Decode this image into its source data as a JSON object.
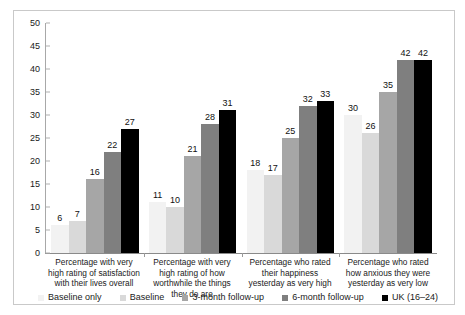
{
  "chart_data": {
    "type": "bar",
    "title": "",
    "subtitle": "",
    "xlabel": "",
    "ylabel": "",
    "ylim": [
      0,
      50
    ],
    "yticks": [
      0,
      5,
      10,
      15,
      20,
      25,
      30,
      35,
      40,
      45,
      50
    ],
    "grid": false,
    "legend_position": "bottom",
    "data_labels": true,
    "categories": [
      "Percentage with very high rating of satisfaction with their lives overall",
      "Percentage with very high rating of how worthwhile the things they do are",
      "Percentage who rated their happiness yesterday as very high",
      "Percentage who rated how anxious they were yesterday as very low"
    ],
    "series": [
      {
        "name": "Baseline only",
        "color": "#f2f2f2",
        "values": [
          6,
          11,
          18,
          30
        ]
      },
      {
        "name": "Baseline",
        "color": "#d9d9d9",
        "values": [
          7,
          10,
          17,
          26
        ]
      },
      {
        "name": "3-month follow-up",
        "color": "#a6a6a6",
        "values": [
          16,
          21,
          25,
          35
        ]
      },
      {
        "name": "6-month follow-up",
        "color": "#7f7f7f",
        "values": [
          22,
          28,
          32,
          42
        ]
      },
      {
        "name": "UK (16–24)",
        "color": "#000000",
        "values": [
          27,
          31,
          33,
          42
        ]
      }
    ]
  },
  "figure": {
    "border_color": "#c9c9c9",
    "background": "#ffffff",
    "axis_color": "#8a8a8a"
  }
}
